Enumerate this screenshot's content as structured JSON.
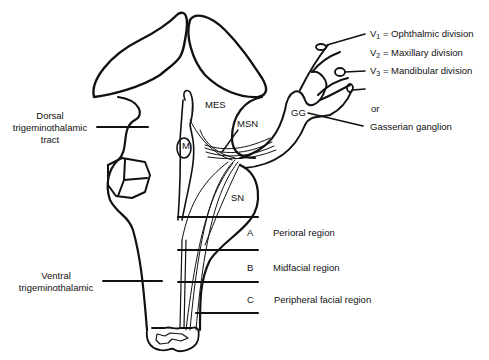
{
  "diagram": {
    "nuclei": {
      "mes": "MES",
      "msn": "MSN",
      "m": "M",
      "sn": "SN",
      "gg": "GG"
    },
    "divisions": [
      {
        "symbol": "V",
        "sub": "1",
        "label": "= Ophthalmic division"
      },
      {
        "symbol": "V",
        "sub": "2",
        "label": "= Maxillary division"
      },
      {
        "symbol": "V",
        "sub": "3",
        "label": "= Mandibular division"
      }
    ],
    "or_text": "or",
    "gasserian": "Gasserian ganglion",
    "dorsal_tract": [
      "Dorsal",
      "trigeminothalamic",
      "tract"
    ],
    "ventral_tract": [
      "Ventral",
      "trigeminothalamic"
    ],
    "regions": [
      {
        "letter": "A",
        "label": "Perioral region"
      },
      {
        "letter": "B",
        "label": "Midfacial region"
      },
      {
        "letter": "C",
        "label": "Peripheral facial region"
      }
    ],
    "colors": {
      "ink": "#111111",
      "background": "#ffffff"
    }
  }
}
